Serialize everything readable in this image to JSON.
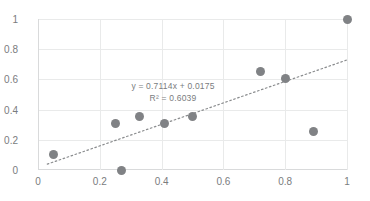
{
  "chart_data": {
    "type": "scatter",
    "title": "",
    "xlabel": "",
    "ylabel": "",
    "xlim": [
      0,
      1
    ],
    "ylim": [
      0,
      1
    ],
    "grid": true,
    "legend": "none",
    "x_ticks": [
      "0",
      "0.2",
      "0.4",
      "0.6",
      "0.8",
      "1"
    ],
    "x_tick_values": [
      0,
      0.2,
      0.4,
      0.6,
      0.8,
      1
    ],
    "y_ticks": [
      "0",
      "0.2",
      "0.4",
      "0.6",
      "0.8",
      "1"
    ],
    "y_tick_values": [
      0,
      0.2,
      0.4,
      0.6,
      0.8,
      1
    ],
    "marker_color": "#808285",
    "trendline_color": "#8a8c8e",
    "gridline_color": "#e9eaea",
    "text_color": "#7a7c7e",
    "points": [
      {
        "x": 0.05,
        "y": 0.1
      },
      {
        "x": 0.25,
        "y": 0.305
      },
      {
        "x": 0.27,
        "y": 0.0
      },
      {
        "x": 0.33,
        "y": 0.355
      },
      {
        "x": 0.41,
        "y": 0.305
      },
      {
        "x": 0.5,
        "y": 0.355
      },
      {
        "x": 0.72,
        "y": 0.655
      },
      {
        "x": 0.8,
        "y": 0.605
      },
      {
        "x": 0.89,
        "y": 0.255
      },
      {
        "x": 1.0,
        "y": 1.0
      }
    ],
    "trendline": {
      "style": "dotted",
      "slope": 0.7114,
      "intercept": 0.0175,
      "x_start": 0.03,
      "x_end": 1.0,
      "r_squared": 0.6039
    },
    "annotations": {
      "equation": "y = 0.7114x + 0.0175",
      "r_squared_label": "R² = 0.6039"
    }
  }
}
